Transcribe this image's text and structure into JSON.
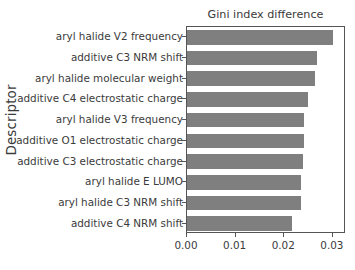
{
  "chart_data": {
    "type": "bar",
    "orientation": "horizontal",
    "title": "Gini index difference",
    "xlabel": "",
    "ylabel": "Descriptor",
    "categories": [
      "aryl halide V2 frequency",
      "additive C3 NRM shift",
      "aryl halide molecular weight",
      "additive C4 electrostatic charge",
      "aryl halide V3 frequency",
      "additive O1 electrostatic charge",
      "additive C3 electrostatic charge",
      "aryl halide E LUMO",
      "aryl halide C3 NRM shift",
      "additive C4 NRM shift"
    ],
    "values": [
      0.03,
      0.0267,
      0.0263,
      0.0248,
      0.024,
      0.024,
      0.0238,
      0.0234,
      0.0234,
      0.0216
    ],
    "xticks": [
      "0.00",
      "0.01",
      "0.02",
      "0.03"
    ],
    "xtick_values": [
      0.0,
      0.01,
      0.02,
      0.03
    ],
    "xlim": [
      0.0,
      0.0327
    ],
    "grid": false,
    "legend": null,
    "bar_color": "#7f7f7f",
    "axis_color": "#555555",
    "text_color": "#3b3b3b"
  }
}
